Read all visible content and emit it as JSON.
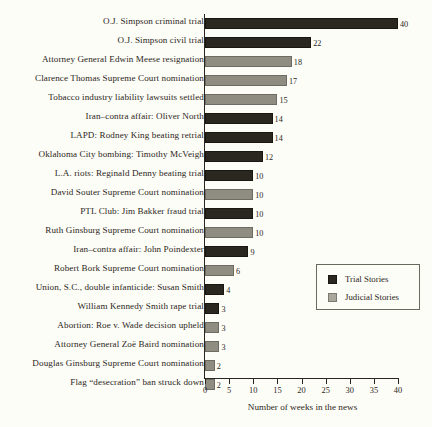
{
  "chart_data": {
    "type": "bar",
    "orientation": "horizontal",
    "title": "",
    "xlabel": "Number of weeks in the news",
    "ylabel": "",
    "xlim": [
      0,
      40
    ],
    "xticks": [
      0,
      5,
      10,
      15,
      20,
      25,
      30,
      35,
      40
    ],
    "xtick_labels": [
      "0",
      "5",
      "10",
      "15",
      "20",
      "25",
      "30",
      "35",
      "40"
    ],
    "grid": false,
    "legend_position": "middle-right",
    "series_colors": {
      "trial": "#2a2620",
      "judicial": "#8f8d82"
    },
    "categories": [
      "O.J. Simpson criminal trial",
      "O.J. Simpson civil trial",
      "Attorney General Edwin Meese resignation",
      "Clarence Thomas Supreme Court nomination",
      "Tobacco industry liability lawsuits settled",
      "Iran–contra affair: Oliver North",
      "LAPD: Rodney King beating retrial",
      "Oklahoma City bombing: Timothy McVeigh",
      "L.A. riots: Reginald Denny beating trial",
      "David Souter Supreme Court nomination",
      "PTL Club: Jim Bakker fraud trial",
      "Ruth Ginsburg Supreme Court nomination",
      "Iran–contra affair: John Poindexter",
      "Robert Bork Supreme Court nomination",
      "Union, S.C., double infanticide: Susan Smith",
      "William Kennedy Smith rape trial",
      "Abortion: Roe v. Wade decision upheld",
      "Attorney General Zoë Baird nomination",
      "Douglas Ginsburg Supreme Court nomination",
      "Flag “desecration” ban struck down"
    ],
    "values": [
      40,
      22,
      18,
      17,
      15,
      14,
      14,
      12,
      10,
      10,
      10,
      10,
      9,
      6,
      4,
      3,
      3,
      3,
      2,
      2
    ],
    "value_labels": [
      "40",
      "22",
      "18",
      "17",
      "15",
      "14",
      "14",
      "12",
      "10",
      "10",
      "10",
      "10",
      "9",
      "6",
      "4",
      "3",
      "3",
      "3",
      "2",
      "2"
    ],
    "categories_series": [
      "trial",
      "trial",
      "judicial",
      "judicial",
      "judicial",
      "trial",
      "trial",
      "trial",
      "trial",
      "judicial",
      "trial",
      "judicial",
      "trial",
      "judicial",
      "trial",
      "trial",
      "judicial",
      "judicial",
      "judicial",
      "judicial"
    ],
    "legend": [
      {
        "label": "Trial Stories",
        "series": "trial"
      },
      {
        "label": "Judicial Stories",
        "series": "judicial"
      }
    ]
  }
}
